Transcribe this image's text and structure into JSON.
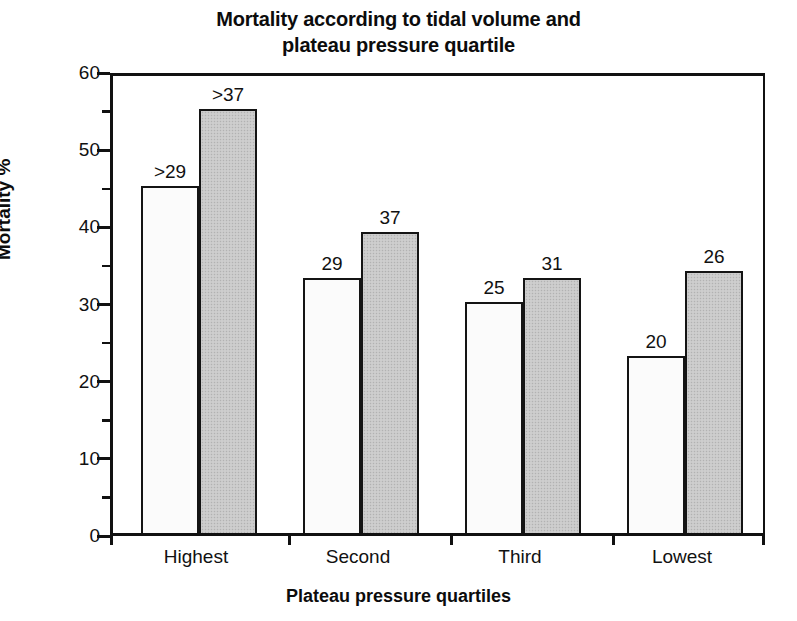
{
  "chart_data": {
    "type": "bar",
    "title": "Mortality according to tidal volume and plateau pressure quartile",
    "title_lines": [
      "Mortality according to tidal volume and",
      "plateau pressure quartile"
    ],
    "xlabel": "Plateau pressure quartiles",
    "ylabel": "Mortality %",
    "categories": [
      "Highest",
      "Second",
      "Third",
      "Lowest"
    ],
    "ylim": [
      0,
      60
    ],
    "ytick_labels": [
      "0",
      "10",
      "20",
      "30",
      "40",
      "50",
      "60"
    ],
    "ytick_values": [
      0,
      10,
      20,
      30,
      40,
      50,
      60
    ],
    "minor_tick_interval": 5,
    "grid": false,
    "legend": "none",
    "series": [
      {
        "name": "Lower tidal volume",
        "style": "light-stippled",
        "color": "#fbfbfb",
        "values": [
          45,
          33,
          30,
          23
        ],
        "point_labels": [
          ">29",
          "29",
          "25",
          "20"
        ]
      },
      {
        "name": "Higher tidal volume",
        "style": "gray-filled",
        "color": "#c9c9c9",
        "values": [
          55,
          39,
          33,
          34
        ],
        "point_labels": [
          ">37",
          "37",
          "31",
          "26"
        ]
      }
    ]
  },
  "axes": {
    "y_tick_positions_pct": [
      0,
      16.666,
      33.333,
      50,
      66.666,
      83.333,
      100
    ],
    "x_tick_positions_pct": [
      0,
      24.4,
      48.9,
      73.3,
      100
    ]
  }
}
